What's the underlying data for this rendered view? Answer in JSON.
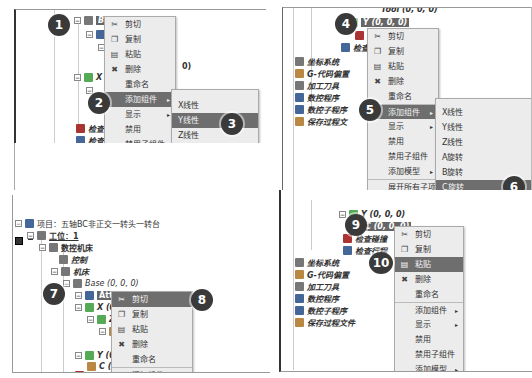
{
  "panels": {
    "p1": {
      "nodes": {
        "base": "Base (0, 0, 0)",
        "attach": "At",
        "x": "X",
        "check1": "检查",
        "check2": "检查",
        "trailing": "0)"
      }
    },
    "p2": {
      "nodes": {
        "tool": "Tool (0, 0, 0)",
        "y": "Y (0, 0, 0)",
        "check_collision": "检查碰",
        "check_travel": "检查行",
        "coord_system": "坐标系统",
        "g_offset": "G-代码偏置",
        "tools": "加工刀具",
        "nc_program": "数控程序",
        "nc_subprogram": "数控子程序",
        "save_process": "保存过程文"
      }
    },
    "p3": {
      "nodes": {
        "project": "项目：五轴BC非正交一转头一转台",
        "station": "工位：1",
        "cnc": "数控机床",
        "control": "控制",
        "machine": "机床",
        "base": "Base (0, 0, 0)",
        "attach": "Attach (0, 0, 0)",
        "x": "X (0, 0",
        "z": "Z (",
        "y": "Y (0, 0",
        "c": "C (",
        "check": "检查碰撞"
      }
    },
    "p4": {
      "nodes": {
        "y": "Y (0, 0, 0)",
        "c": "C (0, 0, 0)",
        "check_collision": "检查碰撞",
        "check_travel": "检查行程",
        "coord_system": "坐标系统",
        "g_offset": "G-代码偏置",
        "tools": "加工刀具",
        "nc_program": "数控程序",
        "nc_subprogram": "数控子程序",
        "save_process": "保存过程文件"
      }
    }
  },
  "context_menu": {
    "cut": "剪切",
    "copy": "复制",
    "paste": "粘贴",
    "delete": "删除",
    "rename": "重命名",
    "add_component": "添加组件",
    "display": "显示",
    "disable": "禁用",
    "disable_children": "禁用子组件",
    "add_model": "添加模型",
    "expand_all": "展开所有子项",
    "expand_component": "展开组件"
  },
  "submenu": {
    "x_linear": "X线性",
    "y_linear": "Y线性",
    "z_linear": "Z线性",
    "a_rotary": "A旋转",
    "b_rotary": "B旋转",
    "c_rotary": "C旋转"
  },
  "icons": {
    "cut": "✂",
    "copy": "❐",
    "paste": "▤",
    "delete": "✖",
    "arrow": "▸",
    "collapse": "−"
  },
  "badges": [
    "1",
    "2",
    "3",
    "4",
    "5",
    "6",
    "7",
    "8",
    "9",
    "10"
  ]
}
